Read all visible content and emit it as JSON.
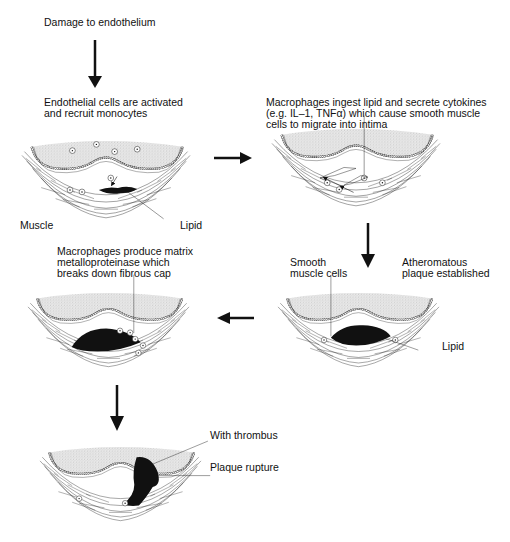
{
  "diagram": {
    "type": "flow",
    "steps": [
      {
        "id": "s0",
        "text": "Damage to endothelium"
      },
      {
        "id": "s1",
        "text_lines": [
          "Endothelial cells are activated",
          "and recruit monocytes"
        ],
        "labels": [
          "Muscle",
          "Lipid"
        ]
      },
      {
        "id": "s2",
        "text_lines": [
          "Macrophages ingest lipid and secrete cytokines",
          "(e.g. IL–1, TNFα) which cause smooth muscle",
          "cells to migrate into intima"
        ]
      },
      {
        "id": "s3",
        "text_lines": [
          "Atheromatous",
          "plaque established"
        ],
        "labels": [
          "Smooth",
          "muscle cells",
          "Lipid"
        ]
      },
      {
        "id": "s4",
        "text_lines": [
          "Macrophages produce matrix",
          "metalloproteinase which",
          "breaks down fibrous cap"
        ]
      },
      {
        "id": "s5",
        "labels": [
          "With thrombus",
          "Plaque rupture"
        ]
      }
    ],
    "arrows": [
      {
        "from": "s0",
        "to": "s1",
        "direction": "down"
      },
      {
        "from": "s1",
        "to": "s2",
        "direction": "right"
      },
      {
        "from": "s2",
        "to": "s3",
        "direction": "down"
      },
      {
        "from": "s3",
        "to": "s4",
        "direction": "left"
      },
      {
        "from": "s4",
        "to": "s5",
        "direction": "down"
      }
    ]
  },
  "text": {
    "damage": "Damage to endothelium",
    "activated_1": "Endothelial cells are activated",
    "activated_2": "and recruit monocytes",
    "muscle": "Muscle",
    "lipid": "Lipid",
    "ingest_1": "Macrophages ingest lipid and secrete cytokines",
    "ingest_2": "(e.g. IL–1, TNFα) which cause smooth muscle",
    "ingest_3": "cells to migrate into intima",
    "smooth_1": "Smooth",
    "smooth_2": "muscle cells",
    "athero_1": "Atheromatous",
    "athero_2": "plaque established",
    "lipid2": "Lipid",
    "mmp_1": "Macrophages produce matrix",
    "mmp_2": "metalloproteinase which",
    "mmp_3": "breaks down fibrous cap",
    "thrombus": "With thrombus",
    "rupture": "Plaque rupture"
  },
  "colors": {
    "ink": "#111111",
    "background": "#ffffff",
    "stipple": "#8a8a8a"
  }
}
